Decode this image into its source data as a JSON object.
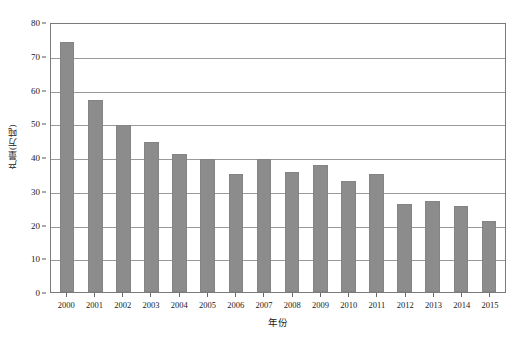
{
  "chart_data": {
    "type": "bar",
    "title": "",
    "xlabel": "年份",
    "ylabel": "产量(万吨)",
    "categories": [
      "2000",
      "2001",
      "2002",
      "2003",
      "2004",
      "2005",
      "2006",
      "2007",
      "2008",
      "2009",
      "2010",
      "2011",
      "2012",
      "2013",
      "2014",
      "2015"
    ],
    "values": [
      74,
      57,
      49.5,
      44.5,
      41,
      39.5,
      35,
      39.5,
      35.5,
      37.5,
      33,
      35,
      26,
      27,
      25.5,
      21
    ],
    "ylim": [
      0,
      80
    ],
    "ytick_labels": [
      "0",
      "10",
      "20",
      "30",
      "40",
      "50",
      "60",
      "70",
      "80"
    ],
    "ytick_values": [
      0,
      10,
      20,
      30,
      40,
      50,
      60,
      70,
      80
    ],
    "grid": "horizontal",
    "legend": "none",
    "bar_color": "#8c8c8c",
    "bar_edge_color": "#848484",
    "gridline_color": "#9a9a9a",
    "axis_color": "#7a7a7a",
    "background_color": "#ffffff"
  }
}
